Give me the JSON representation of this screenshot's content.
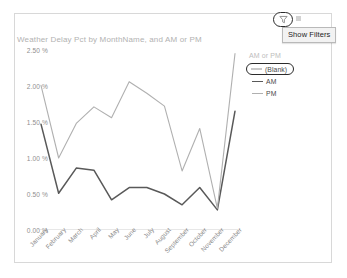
{
  "toolbar": {
    "filter_icon": "funnel-filter-icon",
    "caret_icon": "chevron-down-icon",
    "show_filters_label": "Show Filters"
  },
  "legend": {
    "title": "AM or PM",
    "items": [
      {
        "label": "(Blank)",
        "color": "#c9c9c9",
        "selected": true
      },
      {
        "label": "AM",
        "color": "#595959",
        "selected": false
      },
      {
        "label": "PM",
        "color": "#b0b0b0",
        "selected": false
      }
    ]
  },
  "chart_data": {
    "type": "line",
    "title": "Weather Delay Pct by MonthName, and AM or PM",
    "xlabel": "",
    "ylabel": "",
    "ylim": [
      0,
      2.5
    ],
    "grid": false,
    "legend_position": "right",
    "ytick_labels": [
      "2.50 %",
      "2.00 %",
      "1.50 %",
      "1.00 %",
      "0.50 %",
      "0.00 %"
    ],
    "ytick_values": [
      2.5,
      2.0,
      1.5,
      1.0,
      0.5,
      0.0
    ],
    "categories": [
      "January",
      "February",
      "March",
      "April",
      "May",
      "June",
      "July",
      "August",
      "September",
      "October",
      "November",
      "December"
    ],
    "series": [
      {
        "name": "(Blank)",
        "color": "#c9c9c9",
        "values": [
          null,
          null,
          null,
          null,
          null,
          null,
          null,
          null,
          null,
          null,
          null,
          null
        ]
      },
      {
        "name": "AM",
        "color": "#595959",
        "values": [
          1.47,
          0.51,
          0.86,
          0.83,
          0.42,
          0.59,
          0.59,
          0.5,
          0.35,
          0.59,
          0.28,
          1.65
        ]
      },
      {
        "name": "PM",
        "color": "#b0b0b0",
        "values": [
          2.01,
          1.0,
          1.48,
          1.71,
          1.56,
          2.06,
          1.9,
          1.72,
          0.82,
          1.41,
          0.3,
          2.45
        ]
      }
    ]
  }
}
